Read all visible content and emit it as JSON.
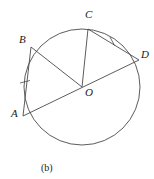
{
  "figure": {
    "caption": "(b)",
    "caption_x": 41,
    "caption_y": 163,
    "stroke_color": "#4a4a4a",
    "label_color": "#1a1a1a",
    "background_color": "#ffffff",
    "circle": {
      "center_label": "O",
      "cx": 82,
      "cy": 87,
      "r": 58,
      "stroke_width": 0.9
    },
    "points": [
      {
        "name": "A",
        "label": "A",
        "x": 23,
        "y": 116,
        "label_x": 11,
        "label_y": 110
      },
      {
        "name": "B",
        "label": "B",
        "x": 31,
        "y": 47,
        "label_x": 19,
        "label_y": 36
      },
      {
        "name": "C",
        "label": "C",
        "x": 88,
        "y": 29,
        "label_x": 85,
        "label_y": 12
      },
      {
        "name": "D",
        "label": "D",
        "x": 139,
        "y": 60,
        "label_x": 140,
        "label_y": 52
      },
      {
        "name": "O",
        "label": "O",
        "x": 82,
        "y": 87,
        "label_x": 85,
        "label_y": 90
      }
    ],
    "segments": [
      {
        "name": "chord-ab",
        "from": "A",
        "to": "B",
        "x1": 23,
        "y1": 116,
        "x2": 31,
        "y2": 47,
        "ticks": 1
      },
      {
        "name": "radius-bo",
        "from": "B",
        "to": "O",
        "x1": 31,
        "y1": 47,
        "x2": 82,
        "y2": 87,
        "ticks": 0
      },
      {
        "name": "radius-co",
        "from": "C",
        "to": "O",
        "x1": 88,
        "y1": 29,
        "x2": 82,
        "y2": 87,
        "ticks": 0
      },
      {
        "name": "chord-cd",
        "from": "C",
        "to": "D",
        "x1": 88,
        "y1": 29,
        "x2": 139,
        "y2": 60,
        "ticks": 1
      },
      {
        "name": "diameter-ad",
        "from": "A",
        "to": "D",
        "x1": 23,
        "y1": 116,
        "x2": 139,
        "y2": 60,
        "ticks": 0
      }
    ],
    "tick_marks": [
      {
        "name": "tick-ab",
        "on": "chord-ab",
        "x1": 20,
        "y1": 83,
        "x2": 30,
        "y2": 80
      },
      {
        "name": "tick-cd",
        "on": "chord-cd",
        "x1": 110,
        "y1": 37,
        "x2": 115,
        "y2": 46
      }
    ]
  }
}
